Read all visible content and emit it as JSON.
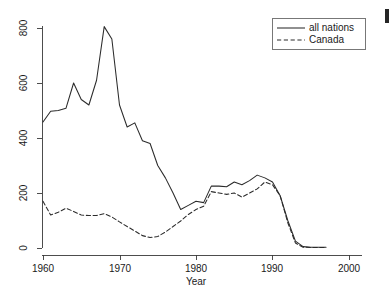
{
  "chart_data": {
    "type": "line",
    "title": "",
    "xlabel": "Year",
    "ylabel": "",
    "xlim": [
      1960,
      2000
    ],
    "ylim": [
      0,
      840
    ],
    "grid": false,
    "legend_position": "top-right",
    "xticks": [
      1960,
      1970,
      1980,
      1990,
      2000
    ],
    "yticks": [
      0,
      200,
      400,
      600,
      800
    ],
    "x": [
      1960,
      1961,
      1962,
      1963,
      1964,
      1965,
      1966,
      1967,
      1968,
      1969,
      1970,
      1971,
      1972,
      1973,
      1974,
      1975,
      1976,
      1977,
      1978,
      1979,
      1980,
      1981,
      1982,
      1983,
      1984,
      1985,
      1986,
      1987,
      1988,
      1989,
      1990,
      1991,
      1992,
      1993,
      1994,
      1995,
      1996,
      1997
    ],
    "series": [
      {
        "name": "all nations",
        "style": "solid",
        "values": [
          458,
          497,
          500,
          508,
          600,
          540,
          520,
          610,
          805,
          760,
          520,
          440,
          455,
          390,
          380,
          300,
          255,
          200,
          140,
          155,
          170,
          165,
          225,
          225,
          223,
          240,
          230,
          245,
          265,
          255,
          240,
          190,
          100,
          25,
          5,
          3,
          3,
          3
        ]
      },
      {
        "name": "Canada",
        "style": "dashed",
        "values": [
          170,
          120,
          130,
          145,
          133,
          120,
          118,
          118,
          125,
          113,
          95,
          78,
          62,
          45,
          38,
          42,
          58,
          78,
          98,
          122,
          140,
          152,
          205,
          200,
          195,
          200,
          185,
          200,
          215,
          240,
          230,
          190,
          92,
          18,
          3,
          2,
          2,
          2
        ]
      }
    ],
    "annotations": []
  },
  "legend": {
    "entries": [
      {
        "label": "all nations",
        "style": "solid"
      },
      {
        "label": "Canada",
        "style": "dashed"
      }
    ]
  },
  "axes": {
    "x_title": "Year",
    "x_tick_labels": [
      "1960",
      "1970",
      "1980",
      "1990",
      "2000"
    ],
    "y_tick_labels": [
      "0",
      "200",
      "400",
      "600",
      "800"
    ]
  },
  "colors": {
    "background": "#ffffff",
    "line": "#2b2b2b",
    "axis": "#3a3a3a",
    "text": "#1a1a1a",
    "legend_border": "#555555"
  }
}
